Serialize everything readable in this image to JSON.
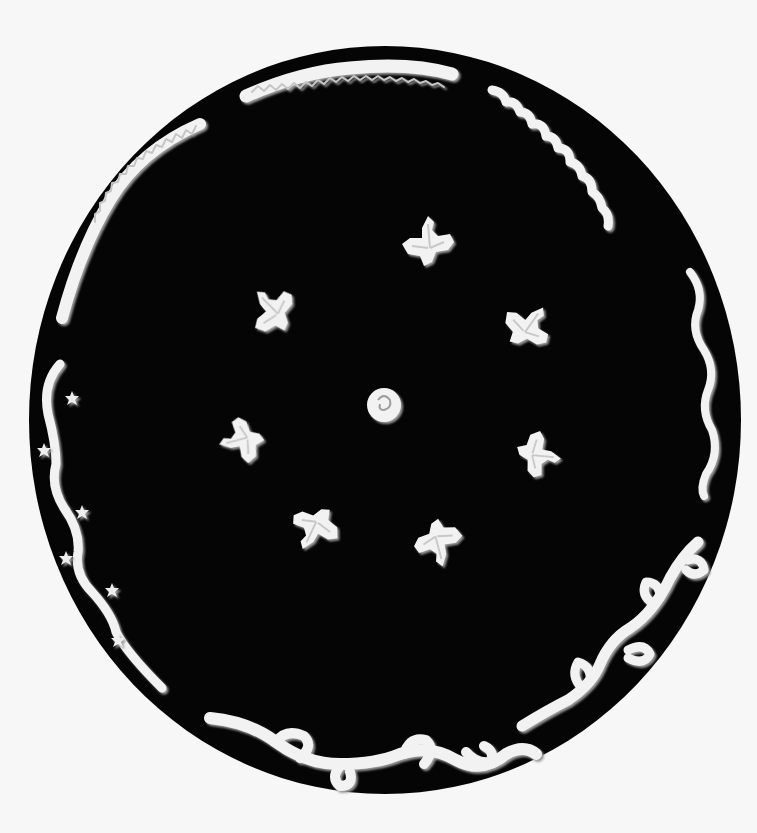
{
  "image": {
    "subject": "Black circular disk with white relief ornaments",
    "background_color": "#f7f7f7",
    "disk_color": "#050505",
    "ornament_color": "#f2f2f2",
    "ornament_shadow": "#bdbdbd"
  },
  "ornaments": {
    "center": "rosette",
    "inner_ring": [
      "leaf-cluster",
      "leaf-cluster",
      "leaf-cluster",
      "leaf-cluster",
      "leaf-cluster",
      "leaf-cluster",
      "leaf-cluster"
    ],
    "border": [
      "twisted-rope-top",
      "wave-top-right",
      "wave-right",
      "acanthus-scroll-bottom-right",
      "acanthus-scroll-bottom",
      "vine-with-flowers-left",
      "twisted-rope-top-left"
    ]
  }
}
